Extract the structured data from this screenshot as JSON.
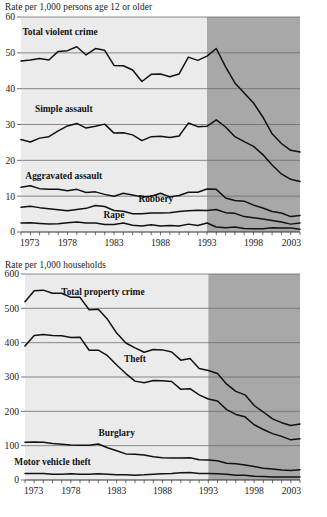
{
  "charts": [
    {
      "id": "violent",
      "caption": "Rate per 1,000 persons age 12 or older",
      "chart_data": {
        "type": "line",
        "title": "Rate per 1,000 persons age 12 or older",
        "xlabel": "",
        "ylabel": "Rate per 1,000 persons age 12 or older",
        "xlim": [
          1973,
          2003
        ],
        "ylim": [
          0,
          60
        ],
        "yticks": [
          0,
          10,
          20,
          30,
          40,
          50,
          60
        ],
        "ytick_labels": [
          "0",
          "10",
          "20",
          "30",
          "40",
          "50",
          "60"
        ],
        "xticks": [
          1973,
          1978,
          1983,
          1988,
          1993,
          1998,
          2003
        ],
        "xtick_labels": [
          "1973",
          "1978",
          "1983",
          "1988",
          "1993",
          "1998",
          "2003"
        ],
        "minor_xtick_interval": 1,
        "grid": "horizontal",
        "legend": "inline-labels",
        "shaded_bands": [
          {
            "from": 1973,
            "to": 1993,
            "color": "#ebebeb",
            "note": "pre-redesign period"
          },
          {
            "from": 1993,
            "to": 2003,
            "color": "#a8a8a8",
            "note": "redesigned survey period"
          }
        ],
        "x": [
          1973,
          1974,
          1975,
          1976,
          1977,
          1978,
          1979,
          1980,
          1981,
          1982,
          1983,
          1984,
          1985,
          1986,
          1987,
          1988,
          1989,
          1990,
          1991,
          1992,
          1993,
          1994,
          1995,
          1996,
          1997,
          1998,
          1999,
          2000,
          2001,
          2002,
          2003
        ],
        "series": [
          {
            "name": "Total violent crime",
            "label_x": 1977.2,
            "label_y": 55.0,
            "values": [
              47.7,
              48.0,
              48.4,
              48.0,
              50.4,
              50.6,
              51.7,
              49.4,
              51.2,
              50.7,
              46.5,
              46.4,
              45.2,
              42.0,
              44.0,
              44.1,
              43.3,
              44.1,
              48.8,
              47.9,
              49.1,
              51.2,
              46.1,
              41.6,
              38.8,
              36.0,
              32.1,
              27.4,
              24.7,
              22.8,
              22.3
            ]
          },
          {
            "name": "Simple assault",
            "label_x": 1977.6,
            "label_y": 33.5,
            "values": [
              25.8,
              25.1,
              26.2,
              26.6,
              28.2,
              29.6,
              30.3,
              29.0,
              29.5,
              30.1,
              27.6,
              27.7,
              27.1,
              25.5,
              26.6,
              26.7,
              26.4,
              26.8,
              30.4,
              29.4,
              29.5,
              31.3,
              29.3,
              26.6,
              25.2,
              23.9,
              21.6,
              18.7,
              16.2,
              14.7,
              14.1
            ]
          },
          {
            "name": "Aggravated assault",
            "label_x": 1977.6,
            "label_y": 14.7,
            "values": [
              12.5,
              12.9,
              12.1,
              11.9,
              11.9,
              11.5,
              11.9,
              11.0,
              11.2,
              10.5,
              10.0,
              10.8,
              10.3,
              9.8,
              10.0,
              10.8,
              9.8,
              10.2,
              11.1,
              11.1,
              12.0,
              11.9,
              9.5,
              8.8,
              8.6,
              7.5,
              6.7,
              5.7,
              5.3,
              4.3,
              4.6
            ]
          },
          {
            "name": "Robbery",
            "label_x": 1987.5,
            "label_y": 8.5,
            "values": [
              6.9,
              7.2,
              6.8,
              6.5,
              6.2,
              5.9,
              6.3,
              6.6,
              7.4,
              7.1,
              6.0,
              5.8,
              5.1,
              5.1,
              5.3,
              5.3,
              5.4,
              5.7,
              5.9,
              6.1,
              6.0,
              6.3,
              5.4,
              5.2,
              4.3,
              4.0,
              3.6,
              3.2,
              2.8,
              2.2,
              2.5
            ]
          },
          {
            "name": "Rape",
            "label_x": 1983.0,
            "label_y": 3.9,
            "values": [
              2.5,
              2.6,
              2.4,
              2.2,
              2.3,
              2.6,
              2.8,
              2.5,
              2.5,
              2.1,
              2.1,
              2.5,
              1.9,
              1.7,
              2.0,
              1.7,
              1.8,
              1.7,
              2.2,
              1.8,
              2.5,
              1.4,
              1.2,
              1.4,
              1.0,
              0.9,
              0.9,
              1.2,
              1.1,
              1.1,
              0.8
            ]
          }
        ]
      }
    },
    {
      "id": "property",
      "caption": "Rate per 1,000 households",
      "chart_data": {
        "type": "line",
        "title": "Rate per 1,000 households",
        "xlabel": "",
        "ylabel": "Rate per 1,000 households",
        "xlim": [
          1973,
          2003
        ],
        "ylim": [
          0,
          600
        ],
        "yticks": [
          0,
          100,
          200,
          300,
          400,
          500,
          600
        ],
        "ytick_labels": [
          "0",
          "100",
          "200",
          "300",
          "400",
          "500",
          "600"
        ],
        "xticks": [
          1973,
          1978,
          1983,
          1988,
          1993,
          1998,
          2003
        ],
        "xtick_labels": [
          "1973",
          "1978",
          "1983",
          "1988",
          "1993",
          "1998",
          "2003"
        ],
        "minor_xtick_interval": 1,
        "grid": "horizontal",
        "legend": "inline-labels",
        "shaded_bands": [
          {
            "from": 1973,
            "to": 1993,
            "color": "#ebebeb",
            "note": "pre-redesign period"
          },
          {
            "from": 1993,
            "to": 2003,
            "color": "#a8a8a8",
            "note": "redesigned survey period"
          }
        ],
        "x": [
          1973,
          1974,
          1975,
          1976,
          1977,
          1978,
          1979,
          1980,
          1981,
          1982,
          1983,
          1984,
          1985,
          1986,
          1987,
          1988,
          1989,
          1990,
          1991,
          1992,
          1993,
          1994,
          1995,
          1996,
          1997,
          1998,
          1999,
          2000,
          2001,
          2002,
          2003
        ],
        "series": [
          {
            "name": "Total property crime",
            "label_x": 1981.5,
            "label_y": 540,
            "values": [
              519,
              551,
              553,
              544,
              544,
              532,
              532,
              496,
              497,
              468,
              428,
              399,
              385,
              372,
              380,
              379,
              373,
              349,
              354,
              325,
              319,
              310,
              279,
              258,
              248,
              217,
              198,
              178,
              167,
              159,
              163
            ]
          },
          {
            "name": "Theft",
            "label_x": 1985.0,
            "label_y": 345,
            "values": [
              390,
              421,
              424,
              421,
              420,
              415,
              416,
              378,
              378,
              362,
              335,
              310,
              288,
              283,
              290,
              289,
              287,
              264,
              266,
              248,
              236,
              230,
              205,
              191,
              184,
              161,
              147,
              135,
              127,
              117,
              120
            ]
          },
          {
            "name": "Burglary",
            "label_x": 1983.0,
            "label_y": 128,
            "values": [
              110,
              111,
              110,
              106,
              104,
              102,
              101,
              101,
              105,
              94,
              85,
              76,
              75,
              73,
              68,
              65,
              64,
              64,
              65,
              59,
              58,
              56,
              49,
              47,
              44,
              39,
              34,
              32,
              29,
              28,
              30
            ]
          },
          {
            "name": "Motor vehicle theft",
            "label_x": 1976.0,
            "label_y": 45,
            "values": [
              19,
              19,
              19,
              17,
              17,
              18,
              17,
              17,
              18,
              17,
              15,
              15,
              14,
              15,
              17,
              18,
              19,
              21,
              22,
              19,
              19,
              18,
              17,
              14,
              14,
              11,
              10,
              9,
              9,
              9,
              9
            ]
          }
        ]
      }
    }
  ]
}
